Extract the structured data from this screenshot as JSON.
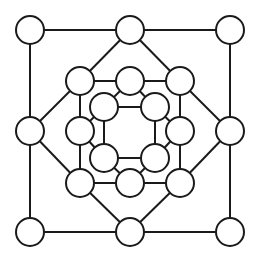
{
  "diagram": {
    "type": "graph",
    "colors": {
      "stroke": "#1a1a1a",
      "fill": "#ffffff",
      "background": "#ffffff"
    },
    "node_radius": 14,
    "nodes": [
      {
        "id": "o1",
        "ring": "outer",
        "x": 30,
        "y": 30
      },
      {
        "id": "o2",
        "ring": "outer",
        "x": 130,
        "y": 30
      },
      {
        "id": "o3",
        "ring": "outer",
        "x": 230,
        "y": 30
      },
      {
        "id": "o4",
        "ring": "outer",
        "x": 230,
        "y": 131
      },
      {
        "id": "o5",
        "ring": "outer",
        "x": 230,
        "y": 232
      },
      {
        "id": "o6",
        "ring": "outer",
        "x": 130,
        "y": 232
      },
      {
        "id": "o7",
        "ring": "outer",
        "x": 30,
        "y": 232
      },
      {
        "id": "o8",
        "ring": "outer",
        "x": 30,
        "y": 131
      },
      {
        "id": "m1",
        "ring": "middle",
        "x": 80,
        "y": 81
      },
      {
        "id": "m2",
        "ring": "middle",
        "x": 130,
        "y": 81
      },
      {
        "id": "m3",
        "ring": "middle",
        "x": 180,
        "y": 81
      },
      {
        "id": "m4",
        "ring": "middle",
        "x": 180,
        "y": 131
      },
      {
        "id": "m5",
        "ring": "middle",
        "x": 180,
        "y": 183
      },
      {
        "id": "m6",
        "ring": "middle",
        "x": 130,
        "y": 183
      },
      {
        "id": "m7",
        "ring": "middle",
        "x": 80,
        "y": 183
      },
      {
        "id": "m8",
        "ring": "middle",
        "x": 80,
        "y": 131
      },
      {
        "id": "i1",
        "ring": "inner",
        "x": 104,
        "y": 107
      },
      {
        "id": "i2",
        "ring": "inner",
        "x": 155,
        "y": 107
      },
      {
        "id": "i3",
        "ring": "inner",
        "x": 155,
        "y": 158
      },
      {
        "id": "i4",
        "ring": "inner",
        "x": 104,
        "y": 158
      }
    ],
    "edges": [
      [
        "o1",
        "o2"
      ],
      [
        "o2",
        "o3"
      ],
      [
        "o3",
        "o4"
      ],
      [
        "o4",
        "o5"
      ],
      [
        "o5",
        "o6"
      ],
      [
        "o6",
        "o7"
      ],
      [
        "o7",
        "o8"
      ],
      [
        "o8",
        "o1"
      ],
      [
        "o2",
        "m1"
      ],
      [
        "o2",
        "m3"
      ],
      [
        "o4",
        "m3"
      ],
      [
        "o4",
        "m5"
      ],
      [
        "o6",
        "m5"
      ],
      [
        "o6",
        "m7"
      ],
      [
        "o8",
        "m7"
      ],
      [
        "o8",
        "m1"
      ],
      [
        "m1",
        "m2"
      ],
      [
        "m2",
        "m3"
      ],
      [
        "m3",
        "m4"
      ],
      [
        "m4",
        "m5"
      ],
      [
        "m5",
        "m6"
      ],
      [
        "m6",
        "m7"
      ],
      [
        "m7",
        "m8"
      ],
      [
        "m8",
        "m1"
      ],
      [
        "i1",
        "i2"
      ],
      [
        "i2",
        "i3"
      ],
      [
        "i3",
        "i4"
      ],
      [
        "i4",
        "i1"
      ],
      [
        "i1",
        "m2"
      ],
      [
        "i1",
        "m8"
      ],
      [
        "i2",
        "m2"
      ],
      [
        "i2",
        "m4"
      ],
      [
        "i3",
        "m4"
      ],
      [
        "i3",
        "m6"
      ],
      [
        "i4",
        "m6"
      ],
      [
        "i4",
        "m8"
      ]
    ]
  }
}
